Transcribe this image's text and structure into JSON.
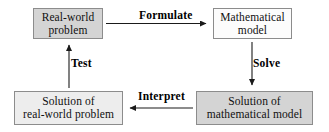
{
  "diagram": {
    "type": "flow-cycle",
    "background_color": "#ffffff",
    "border_color": "#8c8c8c",
    "text_color": "#101010",
    "nodes": [
      {
        "id": "real-world-problem",
        "label": "Real-world\nproblem",
        "fill": "#d4d4d4",
        "position": "top-left"
      },
      {
        "id": "mathematical-model",
        "label": "Mathematical\nmodel",
        "fill": "#fcfcfc",
        "position": "top-right"
      },
      {
        "id": "solution-of-mathematical-model",
        "label": "Solution of\nmathematical model",
        "fill": "#d4d4d4",
        "position": "bottom-right"
      },
      {
        "id": "solution-of-real-world-problem",
        "label": "Solution of\nreal-world problem",
        "fill": "#ededed",
        "position": "bottom-left"
      }
    ],
    "edges": [
      {
        "id": "formulate",
        "label": "Formulate",
        "from": "real-world-problem",
        "to": "mathematical-model",
        "direction": "right"
      },
      {
        "id": "solve",
        "label": "Solve",
        "from": "mathematical-model",
        "to": "solution-of-mathematical-model",
        "direction": "down"
      },
      {
        "id": "interpret",
        "label": "Interpret",
        "from": "solution-of-mathematical-model",
        "to": "solution-of-real-world-problem",
        "direction": "left"
      },
      {
        "id": "test",
        "label": "Test",
        "from": "solution-of-real-world-problem",
        "to": "real-world-problem",
        "direction": "up"
      }
    ]
  }
}
